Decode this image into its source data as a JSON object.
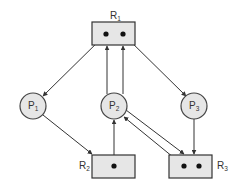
{
  "diagram": {
    "type": "resource-allocation-graph",
    "colors": {
      "fill": "#e6e6e6",
      "stroke": "#333333",
      "instance_dot": "#111111",
      "background": "#ffffff"
    },
    "resources": [
      {
        "id": "R1",
        "label": "R",
        "subscript": "1",
        "instances": 2
      },
      {
        "id": "R2",
        "label": "R",
        "subscript": "2",
        "instances": 1
      },
      {
        "id": "R3",
        "label": "R",
        "subscript": "3",
        "instances": 2
      }
    ],
    "processes": [
      {
        "id": "P1",
        "label": "P",
        "subscript": "1"
      },
      {
        "id": "P2",
        "label": "P",
        "subscript": "2"
      },
      {
        "id": "P3",
        "label": "P",
        "subscript": "3"
      }
    ],
    "edges": [
      {
        "from": "R1",
        "to": "P1",
        "kind": "assignment"
      },
      {
        "from": "R1",
        "to": "P3",
        "kind": "assignment"
      },
      {
        "from": "P2",
        "to": "R1",
        "kind": "request"
      },
      {
        "from": "P2",
        "to": "R1",
        "kind": "request"
      },
      {
        "from": "P1",
        "to": "R2",
        "kind": "request"
      },
      {
        "from": "R2",
        "to": "P2",
        "kind": "assignment"
      },
      {
        "from": "P2",
        "to": "R3",
        "kind": "request"
      },
      {
        "from": "R3",
        "to": "P2",
        "kind": "assignment"
      },
      {
        "from": "P3",
        "to": "R3",
        "kind": "request"
      }
    ]
  }
}
